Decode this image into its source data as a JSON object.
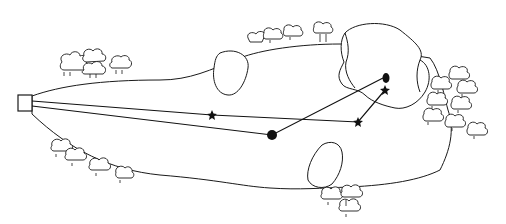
{
  "diagram": {
    "colors": {
      "line": "#1a1a1a",
      "background": "#ffffff",
      "marker": "#111111"
    },
    "tee": {
      "x": 18,
      "y": 95,
      "w": 14,
      "h": 16
    },
    "green": {
      "center": [
        383,
        78
      ]
    },
    "pin": {
      "x": 383,
      "y": 78
    },
    "paths": [
      {
        "name": "path-a",
        "points": [
          [
            32,
            101
          ],
          [
            212,
            115
          ],
          [
            358,
            122
          ],
          [
            385,
            90
          ]
        ]
      },
      {
        "name": "path-b",
        "points": [
          [
            32,
            106
          ],
          [
            272,
            135
          ],
          [
            383,
            78
          ]
        ]
      }
    ],
    "markers": {
      "stars": [
        [
          212,
          115
        ],
        [
          358,
          122
        ],
        [
          385,
          90
        ]
      ],
      "balls": [
        [
          272,
          135
        ]
      ]
    },
    "bunkers": [
      {
        "name": "left-fairway-bunker"
      },
      {
        "name": "right-fairway-bunker"
      },
      {
        "name": "greenside-bunker-left"
      },
      {
        "name": "greenside-bunker-right"
      }
    ],
    "tree_clusters": [
      {
        "name": "trees-top-left",
        "cx": 95,
        "cy": 65
      },
      {
        "name": "trees-top-middle",
        "cx": 295,
        "cy": 35
      },
      {
        "name": "trees-right",
        "cx": 450,
        "cy": 100
      },
      {
        "name": "trees-bottom-left",
        "cx": 90,
        "cy": 160
      },
      {
        "name": "trees-bottom-middle",
        "cx": 345,
        "cy": 200
      }
    ]
  }
}
